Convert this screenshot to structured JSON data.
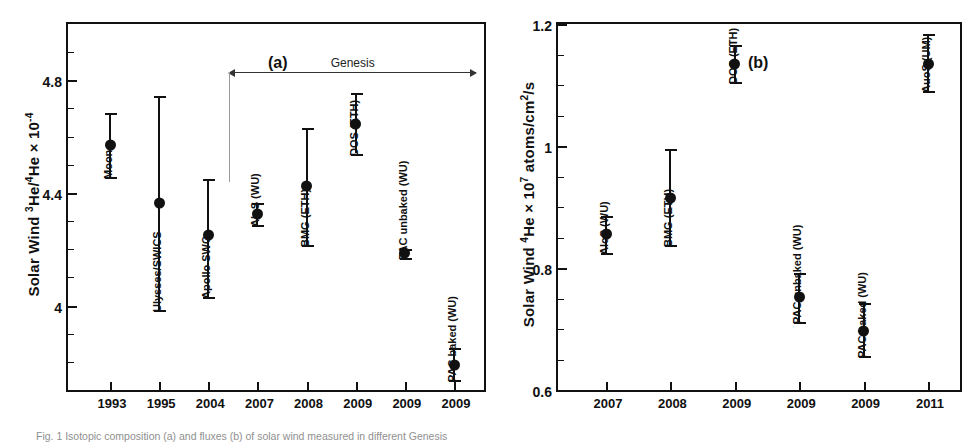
{
  "figure": {
    "caption": "Fig. 1 Isotopic composition (a) and fluxes (b) of solar wind measured in different Genesis"
  },
  "chart_data": [
    {
      "id": "panel-a",
      "type": "scatter",
      "panel_tag": "(a)",
      "title": "",
      "ylabel": "Solar Wind 3He/4He × 10-4",
      "ylabel_parts": {
        "prefix": "Solar Wind ",
        "sup1": "3",
        "mid1": "He/",
        "sup2": "4",
        "mid2": "He × 10",
        "sup3": "-4"
      },
      "xlabel": "",
      "ylim": [
        3.7,
        5.0
      ],
      "ytick_major": [
        4,
        4.4,
        4.8
      ],
      "ytick_major_labels": [
        "4",
        "4.4",
        "4.8"
      ],
      "ytick_minor": [
        3.8,
        3.9,
        4.1,
        4.2,
        4.3,
        4.5,
        4.6,
        4.7,
        4.9
      ],
      "categories": [
        "1993",
        "1995",
        "2004",
        "2007",
        "2008",
        "2009",
        "2009",
        "2009"
      ],
      "annotation": {
        "label": "Genesis",
        "span_from_index": 3,
        "span_to_index": 7
      },
      "points": [
        {
          "label": "Moon",
          "x": "1993",
          "y": 4.57,
          "err_low": 4.455,
          "err_high": 4.685
        },
        {
          "label": "Ulysses/SWICS",
          "x": "1995",
          "y": 4.365,
          "err_low": 3.985,
          "err_high": 4.745
        },
        {
          "label": "Apollo SWC",
          "x": "2004",
          "y": 4.25,
          "err_low": 4.03,
          "err_high": 4.45
        },
        {
          "label": "AloS (WU)",
          "x": "2007",
          "y": 4.325,
          "err_low": 4.285,
          "err_high": 4.365
        },
        {
          "label": "BMG (ETH)",
          "x": "2008",
          "y": 4.425,
          "err_low": 4.215,
          "err_high": 4.63
        },
        {
          "label": "DOS (ETH)",
          "x": "2009",
          "y": 4.645,
          "err_low": 4.54,
          "err_high": 4.755
        },
        {
          "label": "PAC unbaked (WU)",
          "x": "2009",
          "y": 4.185,
          "err_low": 4.17,
          "err_high": 4.2
        },
        {
          "label": "PAC baked (WU)",
          "x": "2009",
          "y": 3.79,
          "err_low": 3.735,
          "err_high": 3.85
        }
      ]
    },
    {
      "id": "panel-b",
      "type": "scatter",
      "panel_tag": "(b)",
      "title": "",
      "ylabel": "Solar Wind 4He × 107 atoms/cm2/s",
      "ylabel_parts": {
        "prefix": "Solar Wind ",
        "sup1": "4",
        "mid1": "He × 10",
        "sup2": "7",
        "mid2": " atoms/cm",
        "sup3": "2",
        "suffix": "/s"
      },
      "xlabel": "",
      "ylim": [
        0.6,
        1.2
      ],
      "ytick_major": [
        0.6,
        0.8,
        1,
        1.2
      ],
      "ytick_major_labels": [
        "0.6",
        "0.8",
        "1",
        "1.2"
      ],
      "ytick_minor": [
        0.65,
        0.7,
        0.75,
        0.85,
        0.9,
        0.95,
        1.05,
        1.1,
        1.15
      ],
      "categories": [
        "2007",
        "2008",
        "2009",
        "2009",
        "2009",
        "2011"
      ],
      "points": [
        {
          "label": "AloS (WU)",
          "x": "2007",
          "y": 0.855,
          "err_low": 0.825,
          "err_high": 0.885
        },
        {
          "label": "BMG (ETH)",
          "x": "2008",
          "y": 0.915,
          "err_low": 0.838,
          "err_high": 0.995
        },
        {
          "label": "DOS (ETH)",
          "x": "2009",
          "y": 1.135,
          "err_low": 1.105,
          "err_high": 1.165
        },
        {
          "label": "PAC unbaked (WU)",
          "x": "2009",
          "y": 0.752,
          "err_low": 0.712,
          "err_high": 0.792
        },
        {
          "label": "PAC baked (WU)",
          "x": "2009",
          "y": 0.697,
          "err_low": 0.655,
          "err_high": 0.742
        },
        {
          "label": "AuoS (UM)",
          "x": "2011",
          "y": 1.135,
          "err_low": 1.09,
          "err_high": 1.183
        }
      ]
    }
  ]
}
